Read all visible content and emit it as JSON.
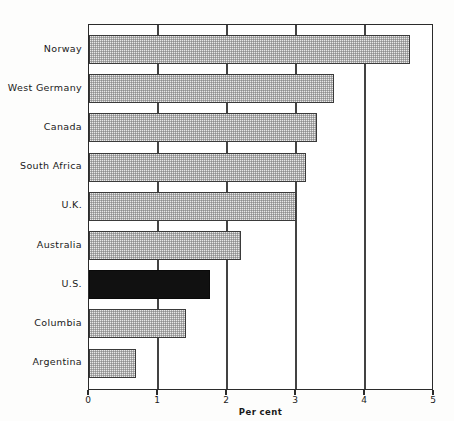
{
  "chart_data": {
    "type": "bar",
    "orientation": "horizontal",
    "title": "",
    "xlabel": "Per cent",
    "ylabel": "",
    "xlim": [
      0,
      5
    ],
    "xticks": [
      "0",
      "1",
      "2",
      "3",
      "4",
      "5"
    ],
    "gridlines": [
      "1",
      "2",
      "3",
      "4"
    ],
    "grid": true,
    "legend": "none",
    "categories": [
      "Norway",
      "West Germany",
      "Canada",
      "South Africa",
      "U.K.",
      "Australia",
      "U.S.",
      "Columbia",
      "Argentina"
    ],
    "values": [
      4.65,
      3.55,
      3.3,
      3.15,
      3.0,
      2.2,
      1.75,
      1.4,
      0.68
    ],
    "bar_styles": [
      "pattern",
      "pattern",
      "pattern",
      "pattern",
      "pattern",
      "pattern",
      "solid",
      "pattern",
      "pattern"
    ],
    "colors": {
      "pattern_fill": "#e8e8e8",
      "solid_fill": "#111111",
      "bar_outline": "#3a3a3a",
      "axis": "#2b2b2b",
      "gridline": "#434343",
      "text": "#1a1a1a",
      "background": "#fdfdfc"
    }
  }
}
